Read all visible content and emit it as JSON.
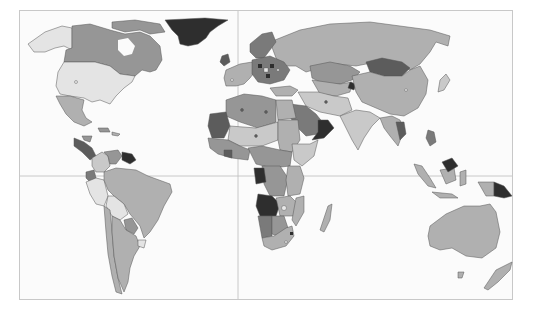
{
  "map": {
    "type": "choropleth",
    "projection": "equirectangular-like world map",
    "legend": null,
    "palette": {
      "ocean": "#fbfbfb",
      "frame": "#c8c8c8",
      "grid": "#bdbdbd",
      "border": "#555555",
      "shade_1": "#e4e4e4",
      "shade_2": "#c9c9c9",
      "shade_3": "#b0b0b0",
      "shade_4": "#969696",
      "shade_5": "#7a7a7a",
      "shade_6": "#5c5c5c",
      "shade_7": "#2e2e2e"
    },
    "gridlines": {
      "prime_meridian_x": 238,
      "equator_y": 176
    },
    "regions": [
      {
        "name": "Greenland",
        "shade": "shade_7"
      },
      {
        "name": "Canada",
        "shade": "shade_4"
      },
      {
        "name": "Alaska",
        "shade": "shade_1"
      },
      {
        "name": "United States",
        "shade": "shade_1"
      },
      {
        "name": "Mexico",
        "shade": "shade_3"
      },
      {
        "name": "Central America",
        "shade": "shade_5"
      },
      {
        "name": "Venezuela / Guianas",
        "shade": "shade_6"
      },
      {
        "name": "Colombia",
        "shade": "shade_2"
      },
      {
        "name": "Ecuador",
        "shade": "shade_5"
      },
      {
        "name": "Peru",
        "shade": "shade_2"
      },
      {
        "name": "Brazil",
        "shade": "shade_3"
      },
      {
        "name": "Bolivia",
        "shade": "shade_1"
      },
      {
        "name": "Paraguay",
        "shade": "shade_4"
      },
      {
        "name": "Argentina",
        "shade": "shade_3"
      },
      {
        "name": "Chile",
        "shade": "shade_3"
      },
      {
        "name": "Uruguay",
        "shade": "shade_1"
      },
      {
        "name": "Russia",
        "shade": "shade_3"
      },
      {
        "name": "Scandinavia",
        "shade": "shade_5"
      },
      {
        "name": "Western Europe",
        "shade": "shade_3"
      },
      {
        "name": "Eastern Europe",
        "shade": "shade_5"
      },
      {
        "name": "Kazakhstan",
        "shade": "shade_4"
      },
      {
        "name": "Mongolia",
        "shade": "shade_6"
      },
      {
        "name": "China",
        "shade": "shade_3"
      },
      {
        "name": "India",
        "shade": "shade_2"
      },
      {
        "name": "Saudi Arabia",
        "shade": "shade_5"
      },
      {
        "name": "Oman / Yemen",
        "shade": "shade_6"
      },
      {
        "name": "Iran",
        "shade": "shade_2"
      },
      {
        "name": "Turkey",
        "shade": "shade_3"
      },
      {
        "name": "North Africa",
        "shade": "shade_4"
      },
      {
        "name": "Mauritania / Mali",
        "shade": "shade_5"
      },
      {
        "name": "Sahel",
        "shade": "shade_2"
      },
      {
        "name": "Egypt",
        "shade": "shade_3"
      },
      {
        "name": "Sudan",
        "shade": "shade_3"
      },
      {
        "name": "Ethiopia / Somalia",
        "shade": "shade_2"
      },
      {
        "name": "West Africa",
        "shade": "shade_4"
      },
      {
        "name": "Central Africa",
        "shade": "shade_4"
      },
      {
        "name": "DR Congo",
        "shade": "shade_4"
      },
      {
        "name": "Angola",
        "shade": "shade_7"
      },
      {
        "name": "East Africa",
        "shade": "shade_3"
      },
      {
        "name": "Namibia",
        "shade": "shade_5"
      },
      {
        "name": "Botswana",
        "shade": "shade_4"
      },
      {
        "name": "Zambia / Zimbabwe",
        "shade": "shade_3"
      },
      {
        "name": "South Africa",
        "shade": "shade_3"
      },
      {
        "name": "Madagascar",
        "shade": "shade_3"
      },
      {
        "name": "Southeast Asia",
        "shade": "shade_3"
      },
      {
        "name": "Indonesia",
        "shade": "shade_3"
      },
      {
        "name": "Malaysia (Borneo)",
        "shade": "shade_6"
      },
      {
        "name": "Papua New Guinea",
        "shade": "shade_7"
      },
      {
        "name": "Australia",
        "shade": "shade_3"
      },
      {
        "name": "New Zealand",
        "shade": "shade_3"
      },
      {
        "name": "Japan",
        "shade": "shade_2"
      },
      {
        "name": "Philippines",
        "shade": "shade_5"
      }
    ]
  }
}
